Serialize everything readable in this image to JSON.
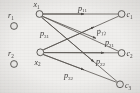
{
  "figure": {
    "type": "bipartite-network-diagram",
    "style": "scanned-grayscale",
    "background_color": "#efeeec",
    "stroke_color": "#4a4744",
    "text_color": "#343230"
  },
  "nodes": {
    "isolated": [
      {
        "id": "r1",
        "label": "r",
        "sub": "1",
        "cx": 14,
        "cy": 26,
        "label_x": 10,
        "label_y": 12,
        "r": 3.6
      },
      {
        "id": "r2",
        "label": "r",
        "sub": "2",
        "cx": 14,
        "cy": 64,
        "label_x": 10,
        "label_y": 50,
        "r": 3.6
      }
    ],
    "sources": [
      {
        "id": "x1",
        "label": "x",
        "sub": "1",
        "cx": 39,
        "cy": 14,
        "label_x": 34,
        "label_y": 8,
        "r": 3.6
      },
      {
        "id": "x2",
        "label": "x",
        "sub": "2",
        "cx": 40,
        "cy": 52,
        "label_x": 35,
        "label_y": 63,
        "r": 3.6
      }
    ],
    "sinks": [
      {
        "id": "c1",
        "label": "c",
        "sub": "1",
        "cx": 122,
        "cy": 14,
        "label_x": 128,
        "label_y": 17,
        "r": 3.6
      },
      {
        "id": "c2",
        "label": "c",
        "sub": "2",
        "cx": 122,
        "cy": 53,
        "label_x": 128,
        "label_y": 56,
        "r": 3.6
      },
      {
        "id": "c3",
        "label": "c",
        "sub": "3",
        "cx": 120,
        "cy": 84,
        "label_x": 126,
        "label_y": 88,
        "r": 3.6
      }
    ]
  },
  "edges": [
    {
      "id": "e-x1-c1",
      "from": "x1",
      "to": "c1",
      "label": "p",
      "sub": "11",
      "label_x": 80,
      "label_y": 10
    },
    {
      "id": "e-x1-c2",
      "from": "x1",
      "to": "c2",
      "label": "p",
      "sub": "12",
      "label_x": 99,
      "label_y": 33
    },
    {
      "id": "e-x1-c3",
      "from": "x1",
      "to": "c3",
      "label": "p",
      "sub": "22",
      "label_x": 99,
      "label_y": 62
    },
    {
      "id": "e-x2-c1",
      "from": "x2",
      "to": "c1",
      "label": "p",
      "sub": "31",
      "label_x": 42,
      "label_y": 35
    },
    {
      "id": "e-x2-c2",
      "from": "x2",
      "to": "c2",
      "label": "p",
      "sub": "21",
      "label_x": 108,
      "label_y": 44
    },
    {
      "id": "e-x2-c3",
      "from": "x2",
      "to": "c3",
      "label": "p",
      "sub": "32",
      "label_x": 67,
      "label_y": 76
    }
  ],
  "edge_labels": [
    {
      "text": "p11",
      "base": "p",
      "sub": "11"
    },
    {
      "text": "p12",
      "base": "p",
      "sub": "12"
    },
    {
      "text": "p21",
      "base": "p",
      "sub": "21"
    },
    {
      "text": "p22",
      "base": "p",
      "sub": "22"
    },
    {
      "text": "p31",
      "base": "p",
      "sub": "31"
    },
    {
      "text": "p32",
      "base": "p",
      "sub": "32"
    }
  ]
}
